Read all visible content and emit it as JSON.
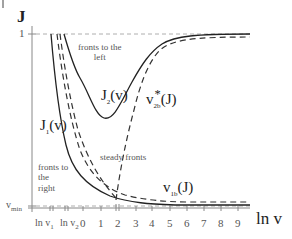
{
  "axes": {
    "y_title": "J",
    "x_title": "ln v",
    "y_ticks": [
      {
        "label": "1",
        "y": 34
      },
      {
        "label": "v",
        "sub": "min",
        "y": 206
      }
    ],
    "x_ticks": [
      {
        "label": "ln v",
        "sub": "1",
        "x": 50
      },
      {
        "label": "ln v",
        "sub": "2",
        "x": 65
      },
      {
        "label": "0",
        "x": 83
      },
      {
        "label": "1",
        "x": 101
      },
      {
        "label": "2",
        "x": 118
      },
      {
        "label": "3",
        "x": 136
      },
      {
        "label": "4",
        "x": 152
      },
      {
        "label": "5",
        "x": 170
      },
      {
        "label": "6",
        "x": 187
      },
      {
        "label": "7",
        "x": 204
      },
      {
        "label": "8",
        "x": 221
      },
      {
        "label": "9",
        "x": 238
      }
    ]
  },
  "curve_labels": {
    "j1": {
      "main": "J",
      "sub": "1",
      "tail": "(v)"
    },
    "j2": {
      "main": "J",
      "sub": "2",
      "tail": "(v)"
    },
    "v2b": {
      "main": "v",
      "sub": "2b",
      "sup": "*",
      "tail": "(J)"
    },
    "v1b": {
      "main": "v",
      "sub": "1b",
      "tail": "(J)"
    }
  },
  "regions": {
    "left": "fronts to the\nleft",
    "right": "fronts to\nthe\nright",
    "steady": "steady fronts"
  },
  "colors": {
    "curve": "#222222",
    "dashed": "#333333",
    "reference": "#888888",
    "axis": "#888888"
  }
}
